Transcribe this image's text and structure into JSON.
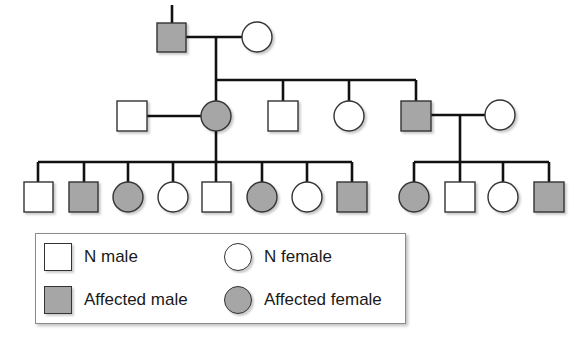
{
  "colors": {
    "affected_fill": "#a6a6a6",
    "normal_fill": "#ffffff",
    "line": "#111111"
  },
  "pedigree": {
    "generation_1": [
      {
        "sex": "male",
        "affected": true
      },
      {
        "sex": "female",
        "affected": false
      }
    ],
    "generation_2": [
      {
        "sex": "male",
        "affected": false,
        "role": "spouse"
      },
      {
        "sex": "female",
        "affected": true
      },
      {
        "sex": "male",
        "affected": false
      },
      {
        "sex": "female",
        "affected": false
      },
      {
        "sex": "male",
        "affected": true
      },
      {
        "sex": "female",
        "affected": false,
        "role": "spouse"
      }
    ],
    "generation_3_family_a": [
      {
        "sex": "male",
        "affected": false
      },
      {
        "sex": "male",
        "affected": true
      },
      {
        "sex": "female",
        "affected": true
      },
      {
        "sex": "female",
        "affected": false
      },
      {
        "sex": "male",
        "affected": false
      },
      {
        "sex": "female",
        "affected": true
      },
      {
        "sex": "female",
        "affected": false
      },
      {
        "sex": "male",
        "affected": true
      }
    ],
    "generation_3_family_b": [
      {
        "sex": "female",
        "affected": true
      },
      {
        "sex": "male",
        "affected": false
      },
      {
        "sex": "female",
        "affected": false
      },
      {
        "sex": "male",
        "affected": true
      }
    ]
  },
  "legend": {
    "items": [
      {
        "label": "N male",
        "shape": "square",
        "affected": false
      },
      {
        "label": "N female",
        "shape": "circle",
        "affected": false
      },
      {
        "label": "Affected male",
        "shape": "square",
        "affected": true
      },
      {
        "label": "Affected female",
        "shape": "circle",
        "affected": true
      }
    ]
  }
}
